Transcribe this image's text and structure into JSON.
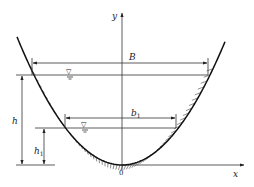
{
  "diagram": {
    "axes": {
      "x_label": "x",
      "y_label": "y",
      "origin_label": "0"
    },
    "dimensions": {
      "top_width_label": "B",
      "lower_width_label": "b",
      "lower_width_subscript": "1",
      "depth_label": "h",
      "lower_depth_label": "h",
      "lower_depth_subscript": "1"
    },
    "water_surface_symbol": "▽",
    "colors": {
      "line": "#333333",
      "boundary": "#111111",
      "background": "#ffffff"
    }
  }
}
